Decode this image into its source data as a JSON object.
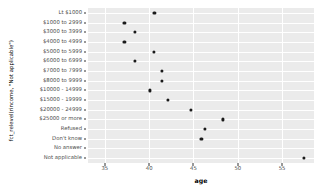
{
  "chart_data": {
    "type": "scatter",
    "title": "",
    "xlabel": "age",
    "ylabel": "fct_relevel(rincome, \"Not applicable\")",
    "xlim": [
      33.1,
      58.6
    ],
    "xticks": [
      35,
      40,
      45,
      50,
      55
    ],
    "xtick_labels": [
      "35",
      "40",
      "45",
      "50",
      "55"
    ],
    "grid": true,
    "legend": "none",
    "categories": [
      "Lt $1000",
      "$1000 to 2999",
      "$3000 to 3999",
      "$4000 to 4999",
      "$5000 to 5999",
      "$6000 to 6999",
      "$7000 to 7999",
      "$8000 to 9999",
      "$10000 - 14999",
      "$15000 - 19999",
      "$20000 - 24999",
      "$25000 or more",
      "Refused",
      "Don't know",
      "No answer",
      "Not applicable"
    ],
    "points": [
      {
        "category": "Lt $1000",
        "age": 40.6
      },
      {
        "category": "$1000 to 2999",
        "age": 37.2
      },
      {
        "category": "$3000 to 3999",
        "age": 38.4
      },
      {
        "category": "$4000 to 4999",
        "age": 37.2
      },
      {
        "category": "$5000 to 5999",
        "age": 40.5
      },
      {
        "category": "$6000 to 6999",
        "age": 38.4
      },
      {
        "category": "$7000 to 7999",
        "age": 41.4
      },
      {
        "category": "$8000 to 9999",
        "age": 41.4
      },
      {
        "category": "$10000 - 14999",
        "age": 40.1
      },
      {
        "category": "$15000 - 19999",
        "age": 42.1
      },
      {
        "category": "$20000 - 24999",
        "age": 44.7
      },
      {
        "category": "$25000 or more",
        "age": 48.3
      },
      {
        "category": "Refused",
        "age": 46.3
      },
      {
        "category": "Don't know",
        "age": 45.9
      },
      {
        "category": "Not applicable",
        "age": 57.5
      }
    ],
    "colors": {
      "panel_background": "#ebebeb",
      "gridline": "#ffffff",
      "point": "#1a1a1a",
      "axis_text": "#4d4d4d",
      "axis_title": "#000000",
      "plot_background": "#ffffff"
    }
  }
}
